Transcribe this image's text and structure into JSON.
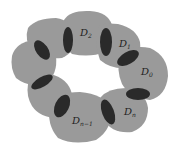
{
  "diagram": {
    "colors": {
      "region": "#9a9a9a",
      "overlap": "#2a2a2a",
      "background": "#ffffff"
    },
    "labels": [
      {
        "id": "D2",
        "base": "D",
        "sub": "2"
      },
      {
        "id": "D1",
        "base": "D",
        "sub": "1"
      },
      {
        "id": "D0",
        "base": "D",
        "sub": "0"
      },
      {
        "id": "Dn",
        "base": "D",
        "sub": "n"
      },
      {
        "id": "Dn-1",
        "base": "D",
        "sub": "n−1"
      }
    ]
  }
}
